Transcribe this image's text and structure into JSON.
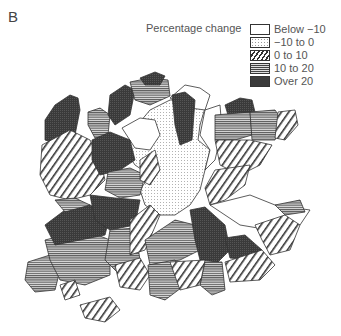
{
  "panel": {
    "label": "B"
  },
  "legend": {
    "title": "Percentage change",
    "items": [
      {
        "label": "Below −10",
        "pattern": "blank",
        "fill": "#ffffff"
      },
      {
        "label": "−10 to 0",
        "pattern": "dotted",
        "fill": "#f2f2f2"
      },
      {
        "label": "0 to 10",
        "pattern": "diagonal-hatch",
        "fill": "#ffffff"
      },
      {
        "label": "10 to 20",
        "pattern": "horizontal-lines",
        "fill": "#bbbbbb"
      },
      {
        "label": "Over 20",
        "pattern": "dense-stipple",
        "fill": "#3a3a3a"
      }
    ]
  },
  "map": {
    "description": "Choropleth map of districts shaded by percentage change",
    "colors": {
      "outline": "#333333",
      "dark": "#3a3a3a",
      "hatch": "#444444"
    }
  }
}
